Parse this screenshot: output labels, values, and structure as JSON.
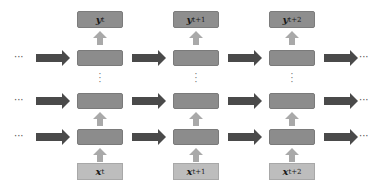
{
  "diagram": {
    "type": "deep-rnn",
    "columns": [
      {
        "output": "y",
        "output_sub": "t",
        "input": "x",
        "input_sub": "t"
      },
      {
        "output": "y",
        "output_sub": "t+1",
        "input": "x",
        "input_sub": "t+1"
      },
      {
        "output": "y",
        "output_sub": "t+2",
        "input": "x",
        "input_sub": "t+2"
      }
    ],
    "ellipsis_h": "···",
    "ellipsis_v": "⋮",
    "colors": {
      "hidden_cell": "#8c8c8c",
      "output_box": "#8e8e8e",
      "input_box": "#bdbdbd",
      "recurrent_arrow": "#4a4a4a",
      "vertical_arrow": "#a9a9a9"
    }
  }
}
